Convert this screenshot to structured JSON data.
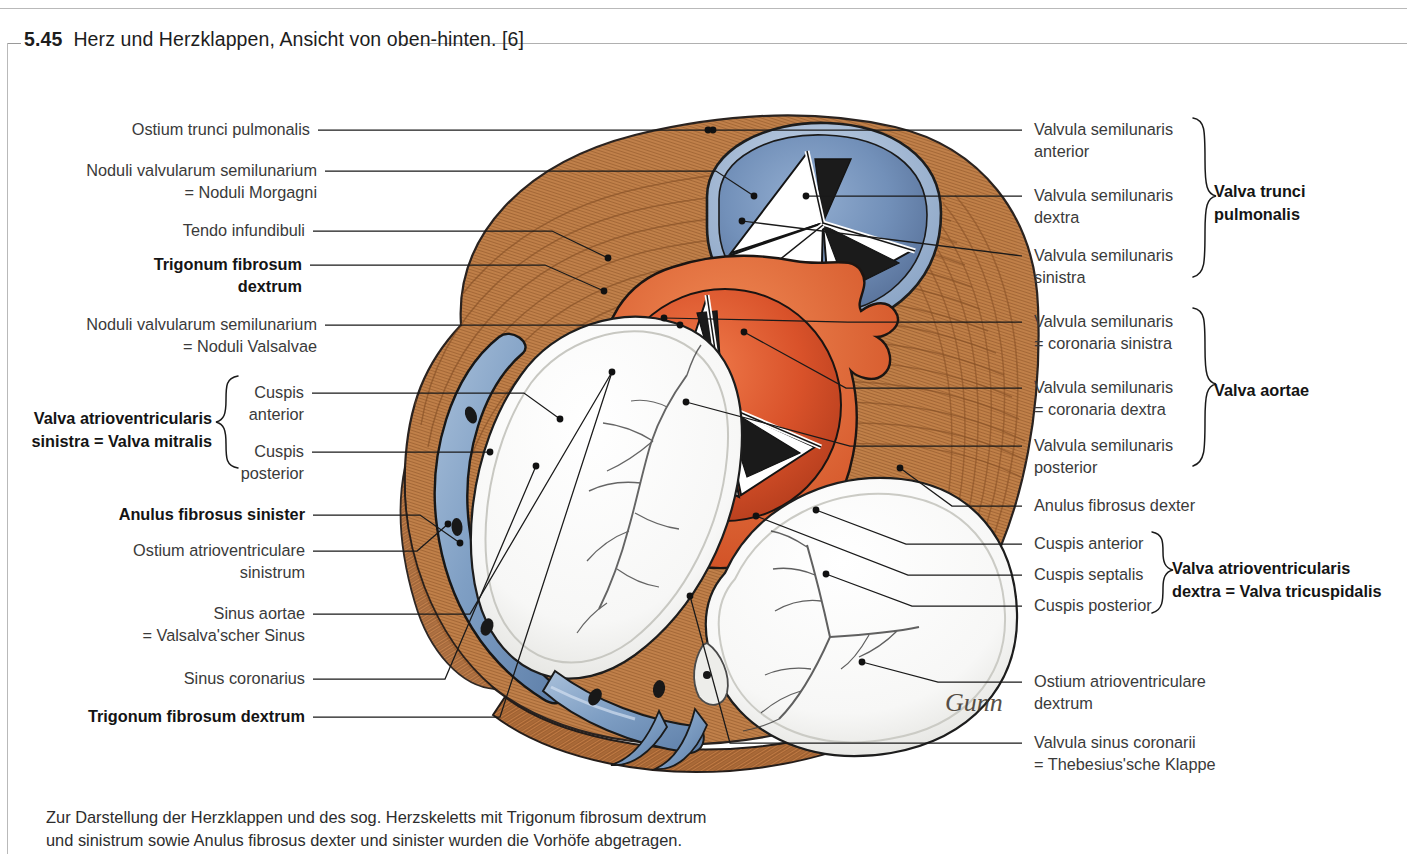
{
  "figure": {
    "number": "5.45",
    "title": "Herz und Herzklappen, Ansicht von oben-hinten. [6]",
    "caption": "Zur Darstellung der Herzklappen und des sog. Herzskeletts mit Trigonum fibrosum dextrum\nund sinistrum sowie Anulus fibrosus dexter und sinister wurden die Vorhöfe abgetragen."
  },
  "labels_left": [
    {
      "id": "ostium-trunci-pulmonalis",
      "text": "Ostium trunci pulmonalis",
      "bold": false
    },
    {
      "id": "noduli-morgagni",
      "text": "Noduli valvularum semilunarium\n= Noduli Morgagni",
      "bold": false
    },
    {
      "id": "tendo-infundibuli",
      "text": "Tendo infundibuli",
      "bold": false
    },
    {
      "id": "trigonum-fibrosum-dextrum-top",
      "text": "Trigonum fibrosum\ndextrum",
      "bold": true
    },
    {
      "id": "noduli-valsalvae",
      "text": "Noduli valvularum semilunarium\n= Noduli Valsalvae",
      "bold": false
    },
    {
      "id": "cuspis-anterior-mitral",
      "text": "Cuspis\nanterior",
      "bold": false
    },
    {
      "id": "cuspis-posterior-mitral",
      "text": "Cuspis\nposterior",
      "bold": false
    },
    {
      "id": "anulus-fibrosus-sinister",
      "text": "Anulus fibrosus sinister",
      "bold": true
    },
    {
      "id": "ostium-atrioventriculare-sinistrum",
      "text": "Ostium atrioventriculare\nsinistrum",
      "bold": false
    },
    {
      "id": "sinus-aortae",
      "text": "Sinus aortae\n= Valsalva'scher Sinus",
      "bold": false
    },
    {
      "id": "sinus-coronarius",
      "text": "Sinus coronarius",
      "bold": false
    },
    {
      "id": "trigonum-fibrosum-dextrum-bottom",
      "text": "Trigonum fibrosum dextrum",
      "bold": true
    }
  ],
  "group_left": {
    "id": "valva-mitralis",
    "text": "Valva atrioventricularis\nsinistra = Valva mitralis",
    "bold": true
  },
  "labels_right": [
    {
      "id": "valvula-semilunaris-anterior",
      "text": "Valvula semilunaris\nanterior",
      "bold": false
    },
    {
      "id": "valvula-semilunaris-dextra",
      "text": "Valvula semilunaris\ndextra",
      "bold": false
    },
    {
      "id": "valvula-semilunaris-sinistra",
      "text": "Valvula semilunaris\nsinistra",
      "bold": false
    },
    {
      "id": "valvula-coronaria-sinistra",
      "text": "Valvula semilunaris\n= coronaria sinistra",
      "bold": false
    },
    {
      "id": "valvula-coronaria-dextra",
      "text": "Valvula semilunaris\n= coronaria dextra",
      "bold": false
    },
    {
      "id": "valvula-semilunaris-posterior",
      "text": "Valvula semilunaris\nposterior",
      "bold": false
    },
    {
      "id": "anulus-fibrosus-dexter",
      "text": "Anulus fibrosus dexter",
      "bold": false
    },
    {
      "id": "cuspis-anterior-tricuspid",
      "text": "Cuspis anterior",
      "bold": false
    },
    {
      "id": "cuspis-septalis",
      "text": "Cuspis septalis",
      "bold": false
    },
    {
      "id": "cuspis-posterior-tricuspid",
      "text": "Cuspis posterior",
      "bold": false
    },
    {
      "id": "ostium-atrioventriculare-dextrum",
      "text": "Ostium atrioventriculare\ndextrum",
      "bold": false
    },
    {
      "id": "valvula-sinus-coronarii",
      "text": "Valvula sinus coronarii\n= Thebesius'sche Klappe",
      "bold": false
    }
  ],
  "groups_right": [
    {
      "id": "valva-trunci-pulmonalis",
      "text": "Valva trunci\npulmonalis",
      "bold": true
    },
    {
      "id": "valva-aortae",
      "text": "Valva aortae",
      "bold": true
    },
    {
      "id": "valva-tricuspidalis",
      "text": "Valva atrioventricularis\ndextra = Valva tricuspidalis",
      "bold": true
    }
  ],
  "colors": {
    "myocardium": "#c8854f",
    "myocardium_dark": "#8a5227",
    "pulmonary_valve": "#6f8fbe",
    "aortic_valve": "#e0562a",
    "anulus_blue": "#7a9cc6",
    "fibrous_white": "#fbfbfb",
    "leader_line": "#1a1a1a",
    "rule": "#b9b9b9",
    "text": "#3a3a3a"
  },
  "signature": "Gunn"
}
